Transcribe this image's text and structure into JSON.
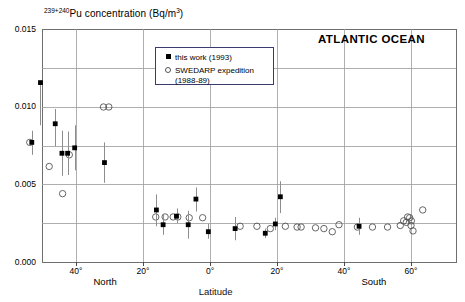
{
  "chart_data": {
    "type": "scatter",
    "title": "239+240Pu concentration (Bq/m3)",
    "title_sup": "239+240",
    "title_rest": "Pu concentration (Bq/m",
    "title_sup2": "3",
    "title_tail": ")",
    "annotation": "ATLANTIC OCEAN",
    "xlabel": "Latitude",
    "ylabel": "239+240Pu concentration (Bq/m3)",
    "xlim": [
      -52,
      72
    ],
    "ylim": [
      0.0,
      0.015
    ],
    "grid": true,
    "y_ticks": [
      "0.000",
      "0.005",
      "0.010",
      "0.015"
    ],
    "y_tick_values": [
      0.0,
      0.005,
      0.01,
      0.015
    ],
    "y_minor_values": [
      0.0025,
      0.0075,
      0.0125
    ],
    "x_ticks": [
      "40°",
      "20°",
      "0°",
      "20°",
      "40°",
      "60°"
    ],
    "x_tick_values": [
      40,
      20,
      0,
      -20,
      -40,
      -60
    ],
    "hemisphere_labels": [
      {
        "text": "North",
        "lat": 30
      },
      {
        "text": "South",
        "lat": -50
      }
    ],
    "legend": {
      "position": "top-center",
      "entries": [
        {
          "label": "this work (1993)",
          "marker": "filled-square",
          "color": "#000000"
        },
        {
          "label": "SWEDARP expedition",
          "label2": "(1988-89)",
          "marker": "open-circle",
          "color": "#555555"
        }
      ]
    },
    "series": [
      {
        "name": "this work (1993)",
        "marker": "filled-square",
        "color": "#000000",
        "points": [
          {
            "lat": 50.6,
            "value": 0.01155,
            "err_lo": 0.0088,
            "err_hi": 0.01155
          },
          {
            "lat": 53.2,
            "value": 0.0077,
            "err_lo": 0.0069,
            "err_hi": 0.00845
          },
          {
            "lat": 46.2,
            "value": 0.0089,
            "err_lo": 0.00745,
            "err_hi": 0.00985
          },
          {
            "lat": 44.2,
            "value": 0.007,
            "err_lo": 0.00555,
            "err_hi": 0.00845
          },
          {
            "lat": 42.5,
            "value": 0.007,
            "err_lo": 0.0056,
            "err_hi": 0.0084
          },
          {
            "lat": 40.4,
            "value": 0.00735,
            "err_lo": 0.0059,
            "err_hi": 0.0088
          },
          {
            "lat": 31.5,
            "value": 0.0064,
            "err_lo": 0.0051,
            "err_hi": 0.0077
          },
          {
            "lat": 16.0,
            "value": 0.00335,
            "err_lo": 0.0023,
            "err_hi": 0.00435
          },
          {
            "lat": 14.0,
            "value": 0.0024,
            "err_lo": 0.00175,
            "err_hi": 0.00305
          },
          {
            "lat": 10.0,
            "value": 0.00295,
            "err_lo": 0.0025,
            "err_hi": 0.00345
          },
          {
            "lat": 6.5,
            "value": 0.0024,
            "err_lo": 0.0015,
            "err_hi": 0.0033
          },
          {
            "lat": 4.2,
            "value": 0.00405,
            "err_lo": 0.00325,
            "err_hi": 0.0048
          },
          {
            "lat": 0.5,
            "value": 0.00195,
            "err_lo": 0.0015,
            "err_hi": 0.00245
          },
          {
            "lat": -7.5,
            "value": 0.00215,
            "err_lo": 0.0014,
            "err_hi": 0.0029
          },
          {
            "lat": -16.5,
            "value": 0.00185,
            "err_lo": 0.00155,
            "err_hi": 0.00215
          },
          {
            "lat": -19.5,
            "value": 0.00245,
            "err_lo": 0.00205,
            "err_hi": 0.00285
          },
          {
            "lat": -21.0,
            "value": 0.0042,
            "err_lo": 0.00315,
            "err_hi": 0.0052
          },
          {
            "lat": -44.5,
            "value": 0.0023,
            "err_lo": 0.00175,
            "err_hi": 0.00285
          }
        ]
      },
      {
        "name": "SWEDARP expedition (1988-89)",
        "marker": "open-circle",
        "color": "#555555",
        "points": [
          {
            "lat": 53.8,
            "value": 0.0077
          },
          {
            "lat": 48.0,
            "value": 0.00615
          },
          {
            "lat": 44.0,
            "value": 0.0044
          },
          {
            "lat": 42.0,
            "value": 0.0069
          },
          {
            "lat": 31.8,
            "value": 0.00998
          },
          {
            "lat": 30.2,
            "value": 0.00998
          },
          {
            "lat": 16.2,
            "value": 0.0029
          },
          {
            "lat": 13.4,
            "value": 0.0029
          },
          {
            "lat": 11.0,
            "value": 0.0029
          },
          {
            "lat": 9.6,
            "value": 0.0029
          },
          {
            "lat": 6.2,
            "value": 0.00285
          },
          {
            "lat": 2.2,
            "value": 0.00285
          },
          {
            "lat": -9.0,
            "value": 0.0023
          },
          {
            "lat": -14.0,
            "value": 0.0023
          },
          {
            "lat": -18.0,
            "value": 0.00215
          },
          {
            "lat": -22.5,
            "value": 0.0023
          },
          {
            "lat": -26.0,
            "value": 0.00225
          },
          {
            "lat": -27.2,
            "value": 0.00225
          },
          {
            "lat": -31.5,
            "value": 0.0022
          },
          {
            "lat": -34.0,
            "value": 0.00215
          },
          {
            "lat": -36.5,
            "value": 0.00195
          },
          {
            "lat": -38.5,
            "value": 0.0024
          },
          {
            "lat": -44.0,
            "value": 0.00225
          },
          {
            "lat": -48.5,
            "value": 0.00225
          },
          {
            "lat": -53.0,
            "value": 0.00225
          },
          {
            "lat": -56.8,
            "value": 0.00235
          },
          {
            "lat": -57.8,
            "value": 0.00265
          },
          {
            "lat": -58.6,
            "value": 0.00255
          },
          {
            "lat": -59.0,
            "value": 0.0029
          },
          {
            "lat": -59.6,
            "value": 0.00285
          },
          {
            "lat": -60.1,
            "value": 0.00265
          },
          {
            "lat": -60.0,
            "value": 0.00235
          },
          {
            "lat": -60.6,
            "value": 0.002
          },
          {
            "lat": -63.5,
            "value": 0.00335
          }
        ]
      }
    ]
  }
}
